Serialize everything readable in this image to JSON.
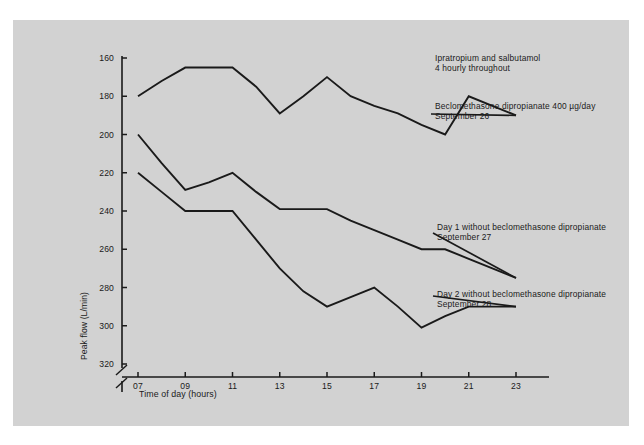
{
  "figure": {
    "background_color": "#ffffff",
    "panel_color": "#d2d2d2",
    "line_color": "#1a1a1a"
  },
  "chart_data": {
    "type": "line",
    "title": "",
    "xlabel": "Time of day (hours)",
    "ylabel": "Peak flow (L/min)",
    "xlim": [
      6,
      24
    ],
    "ylim": [
      155,
      322
    ],
    "yticks": [
      160,
      180,
      200,
      220,
      240,
      260,
      280,
      300,
      320
    ],
    "xticks": [
      7,
      9,
      11,
      13,
      15,
      17,
      19,
      21,
      23
    ],
    "xticklabels": [
      "07",
      "09",
      "11",
      "13",
      "15",
      "17",
      "19",
      "21",
      "23"
    ],
    "y_axis_break": true,
    "grid": false,
    "legend_position": "inline-annotations",
    "x": [
      7,
      8,
      9,
      10,
      11,
      12,
      13,
      14,
      15,
      16,
      17,
      18,
      19,
      20,
      21,
      22,
      23
    ],
    "series": [
      {
        "name": "Beclomethasone dipropianate 400 µg/day — September 26",
        "values": [
          300,
          308,
          315,
          315,
          315,
          305,
          291,
          300,
          310,
          300,
          295,
          291,
          285,
          280,
          300,
          295,
          290
        ]
      },
      {
        "name": "Day 1 without beclomethasone dipropianate — September 27",
        "values": [
          280,
          265,
          251,
          255,
          260,
          250,
          241,
          241,
          241,
          235,
          230,
          225,
          220,
          220,
          215,
          210,
          205
        ]
      },
      {
        "name": "Day 2 without beclomethasone dipropianate — September 28",
        "values": [
          260,
          250,
          240,
          240,
          240,
          225,
          210,
          198,
          190,
          195,
          200,
          190,
          179,
          185,
          190,
          190,
          190
        ]
      }
    ]
  },
  "axis": {
    "yticklabels": [
      "320",
      "300",
      "280",
      "260",
      "240",
      "220",
      "200",
      "180",
      "160"
    ],
    "xticklabels": [
      "07",
      "09",
      "11",
      "13",
      "15",
      "17",
      "19",
      "21",
      "23"
    ],
    "ylabel": "Peak flow (L/min)",
    "xlabel": "Time of day (hours)"
  },
  "annotations": {
    "ipratropium": {
      "line1": "Ipratropium and salbutamol",
      "line2": "4 hourly throughout"
    },
    "beclomethasone": {
      "line1_pre": "Beclomethasone dipropianate 400 ",
      "line1_unit": "µg/day",
      "line2": "September 26"
    },
    "day1": {
      "line1": "Day 1 without beclomethasone dipropianate",
      "line2": "September 27"
    },
    "day2": {
      "line1": "Day 2 without beclomethasone dipropianate",
      "line2": "September 28"
    }
  }
}
